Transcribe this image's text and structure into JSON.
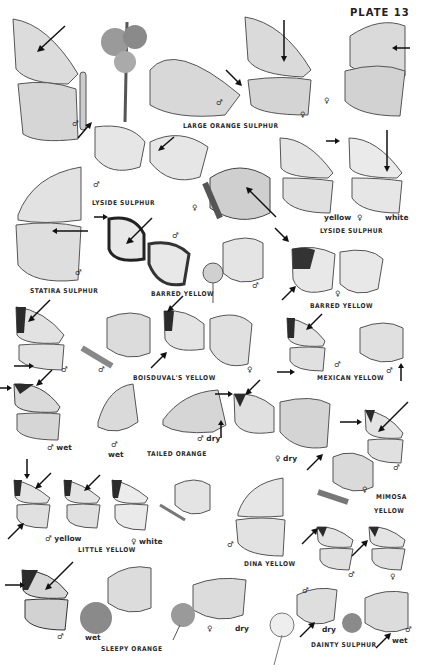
{
  "plate": {
    "title": "PLATE 13"
  },
  "species_labels": [
    {
      "id": "large-orange-sulphur",
      "text": "LARGE ORANGE SULPHUR",
      "x": 183,
      "y": 122
    },
    {
      "id": "lyside-sulphur-1",
      "text": "LYSIDE SULPHUR",
      "x": 92,
      "y": 199
    },
    {
      "id": "lyside-sulphur-2",
      "text": "LYSIDE SULPHUR",
      "x": 320,
      "y": 227
    },
    {
      "id": "statira-sulphur",
      "text": "STATIRA SULPHUR",
      "x": 30,
      "y": 287
    },
    {
      "id": "barred-yellow-1",
      "text": "BARRED YELLOW",
      "x": 151,
      "y": 290
    },
    {
      "id": "barred-yellow-2",
      "text": "BARRED YELLOW",
      "x": 310,
      "y": 302
    },
    {
      "id": "boisduvals-yellow",
      "text": "BOISDUVAL'S YELLOW",
      "x": 133,
      "y": 374
    },
    {
      "id": "mexican-yellow",
      "text": "MEXICAN YELLOW",
      "x": 317,
      "y": 374
    },
    {
      "id": "tailed-orange",
      "text": "TAILED ORANGE",
      "x": 147,
      "y": 450
    },
    {
      "id": "mimosa-yellow-1",
      "text": "MIMOSA",
      "x": 372,
      "y": 493
    },
    {
      "id": "mimosa-yellow-2",
      "text": "YELLOW",
      "x": 372,
      "y": 507
    },
    {
      "id": "little-yellow",
      "text": "LITTLE YELLOW",
      "x": 78,
      "y": 546
    },
    {
      "id": "dina-yellow",
      "text": "DINA YELLOW",
      "x": 244,
      "y": 560
    },
    {
      "id": "sleepy-orange",
      "text": "SLEEPY ORANGE",
      "x": 101,
      "y": 645
    },
    {
      "id": "dainty-sulphur",
      "text": "DAINTY SULPHUR",
      "x": 311,
      "y": 641
    }
  ],
  "notes": [
    {
      "text": "♂",
      "x": 72,
      "y": 119
    },
    {
      "text": "♂",
      "x": 216,
      "y": 98
    },
    {
      "text": "♀",
      "x": 300,
      "y": 110
    },
    {
      "text": "♀",
      "x": 324,
      "y": 96
    },
    {
      "text": "♂",
      "x": 93,
      "y": 180
    },
    {
      "text": "♀",
      "x": 192,
      "y": 203
    },
    {
      "text": "yellow",
      "x": 324,
      "y": 213
    },
    {
      "text": "♀",
      "x": 357,
      "y": 213
    },
    {
      "text": "white",
      "x": 385,
      "y": 213
    },
    {
      "text": "♂",
      "x": 172,
      "y": 231
    },
    {
      "text": "♂",
      "x": 75,
      "y": 268
    },
    {
      "text": "♂",
      "x": 252,
      "y": 281
    },
    {
      "text": "♀",
      "x": 335,
      "y": 289
    },
    {
      "text": "♂",
      "x": 61,
      "y": 365
    },
    {
      "text": "♂",
      "x": 98,
      "y": 365
    },
    {
      "text": "♀",
      "x": 247,
      "y": 365
    },
    {
      "text": "♂",
      "x": 334,
      "y": 360
    },
    {
      "text": "♂",
      "x": 386,
      "y": 366
    },
    {
      "text": "♂ wet",
      "x": 47,
      "y": 443
    },
    {
      "text": "♂",
      "x": 111,
      "y": 440
    },
    {
      "text": "wet",
      "x": 108,
      "y": 450
    },
    {
      "text": "♂ dry",
      "x": 197,
      "y": 434
    },
    {
      "text": "♀ dry",
      "x": 275,
      "y": 454
    },
    {
      "text": "♂",
      "x": 393,
      "y": 463
    },
    {
      "text": "♀",
      "x": 362,
      "y": 485
    },
    {
      "text": "♂ yellow",
      "x": 45,
      "y": 534
    },
    {
      "text": "♀ white",
      "x": 131,
      "y": 537
    },
    {
      "text": "♂",
      "x": 227,
      "y": 540
    },
    {
      "text": "♂",
      "x": 348,
      "y": 570
    },
    {
      "text": "♀",
      "x": 390,
      "y": 572
    },
    {
      "text": "♂",
      "x": 302,
      "y": 586
    },
    {
      "text": "♂",
      "x": 57,
      "y": 632
    },
    {
      "text": "wet",
      "x": 85,
      "y": 633
    },
    {
      "text": "♀",
      "x": 207,
      "y": 624
    },
    {
      "text": "dry",
      "x": 235,
      "y": 624
    },
    {
      "text": "dry",
      "x": 322,
      "y": 625
    },
    {
      "text": "♂",
      "x": 405,
      "y": 625
    },
    {
      "text": "wet",
      "x": 392,
      "y": 636
    }
  ],
  "colors": {
    "ink": "#2a2a2a",
    "wing": "#dcdcdc",
    "wing_dark": "#3a3a3a",
    "background": "#ffffff"
  }
}
